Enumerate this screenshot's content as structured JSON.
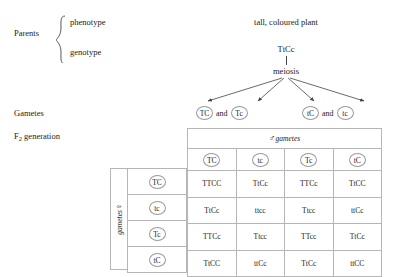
{
  "diagram": {
    "left_labels": {
      "parents": "Parents",
      "gametes": "Gametes",
      "f2_prefix": "F",
      "f2_subscript": "2",
      "f2_suffix": " generation"
    },
    "parent_brace": {
      "phenotype": "phenotype",
      "genotype": "genotype"
    },
    "cross": {
      "phenotype_text": "tall, coloured plant",
      "genotype_text": "TtCc",
      "process_text": "meiosis"
    },
    "gametes_row": {
      "left": {
        "first": "TC",
        "conjunction": "and",
        "second": "Tc"
      },
      "right": {
        "first": "tC",
        "conjunction": "and",
        "second": "tc"
      }
    },
    "punnett": {
      "male_symbol": "♂",
      "male_label": "gametes",
      "female_symbol": "♀",
      "female_label": "gametes",
      "column_headers": [
        "TC",
        "tc",
        "Tc",
        "tC"
      ],
      "row_headers": [
        "TC",
        "tc",
        "Tc",
        "tC"
      ],
      "cells": [
        [
          "TTCC",
          "TtCc",
          "TTCc",
          "TtCC"
        ],
        [
          "TtCc",
          "ttcc",
          "Ttcc",
          "ttCc"
        ],
        [
          "TTCc",
          "Ttcc",
          "TTcc",
          "TtCc"
        ],
        [
          "TtCC",
          "ttCc",
          "TtCc",
          "ttCC"
        ]
      ]
    },
    "colors": {
      "text": "#1a1a1a",
      "rule": "#b6b6b6",
      "circle": "#9a9a9a",
      "background": "#ffffff"
    }
  }
}
